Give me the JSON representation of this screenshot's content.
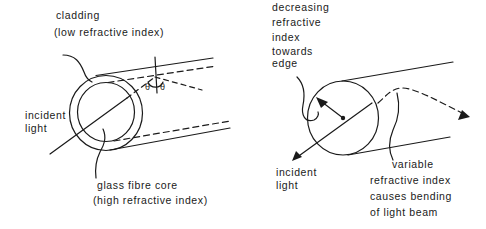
{
  "left_diagram": {
    "title": "step-index optical fibre",
    "labels": {
      "cladding_line1": "cladding",
      "cladding_line2": "(low refractive index)",
      "incident_line1": "incident",
      "incident_line2": "light",
      "core_line1": "glass fibre core",
      "core_line2": "(high refractive index)",
      "theta_left": "θ",
      "theta_right": "θ"
    }
  },
  "right_diagram": {
    "title": "graded-index optical fibre",
    "labels": {
      "decreasing_line1": "decreasing",
      "decreasing_line2": "refractive",
      "decreasing_line3": "index",
      "decreasing_line4": "towards",
      "decreasing_line5": "edge",
      "incident_line1": "incident",
      "incident_line2": "light",
      "variable_line1": "variable",
      "variable_line2": "refractive index",
      "variable_line3": "causes bending",
      "variable_line4": "of light beam"
    }
  },
  "colors": {
    "ink": "#1a1a1a",
    "background": "#ffffff"
  }
}
